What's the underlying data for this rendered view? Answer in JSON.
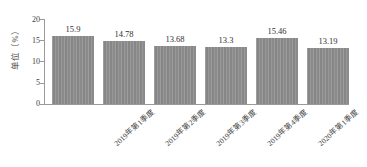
{
  "chart_data": {
    "type": "bar",
    "title": "",
    "subtitle": "",
    "xlabel": "",
    "ylabel": "单位（%）",
    "categories": [
      "2019年第1季度",
      "2019年第2季度",
      "2019年第3季度",
      "2019年第4季度",
      "2020年第1季度",
      "2020年第2季度"
    ],
    "values": [
      15.9,
      14.78,
      13.68,
      13.3,
      15.46,
      13.19
    ],
    "value_labels": [
      "15.9",
      "14.78",
      "13.68",
      "13.3",
      "15.46",
      "13.19"
    ],
    "ylim": [
      0,
      20
    ],
    "y_ticks": [
      0,
      5,
      10,
      15,
      20
    ],
    "y_tick_labels": [
      "0",
      "5",
      "10",
      "15",
      "20"
    ],
    "grid": false,
    "legend": null,
    "bar_color": "#8d8d8d",
    "axis_color": "#9a9a9a",
    "background_color": "#ffffff",
    "label_rotation_deg": -42
  }
}
